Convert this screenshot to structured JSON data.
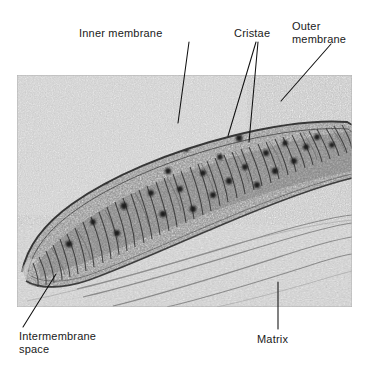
{
  "figure": {
    "kind": "electron-micrograph",
    "background_color": "#ffffff",
    "text_color": "#1a1a1a"
  },
  "labels": {
    "inner_membrane": "Inner membrane",
    "cristae": "Cristae",
    "outer_membrane": "Outer\nmembrane",
    "intermembrane_space": "Intermembrane\nspace",
    "matrix": "Matrix"
  },
  "micrograph": {
    "alt_text": "Transmission electron micrograph of an elongated mitochondrion with stacked cristae and dark matrix granules",
    "tone_light": "#d8d8d8",
    "tone_mid": "#a0a0a0",
    "tone_dark": "#4a4a4a",
    "granule_color": "#1f1f1f",
    "granule_count": 27,
    "crista_count": 46
  },
  "leaders": {
    "inner_membrane": "diagonal down-left into inner membrane",
    "cristae_a": "diagonal down-left to crista stack",
    "cristae_b": "diagonal down to crista stack",
    "outer_membrane": "diagonal down-left to outer membrane",
    "intermembrane_space": "diagonal up-right to intermembrane space",
    "matrix": "vertical up into matrix"
  }
}
